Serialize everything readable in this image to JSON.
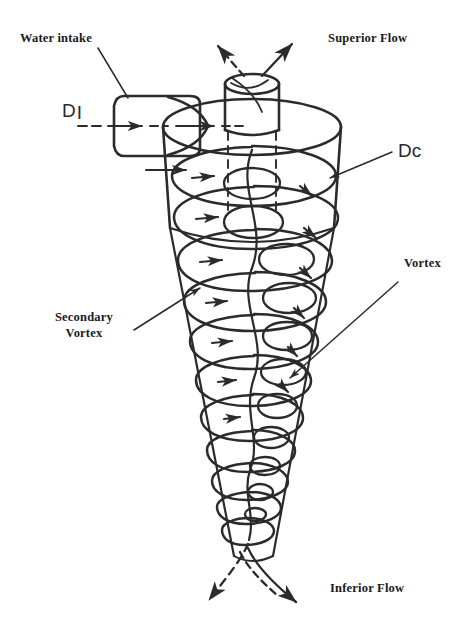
{
  "figure": {
    "type": "technical-line-diagram",
    "background_color": "#ffffff",
    "ink_color": "#2b2b2b",
    "width": 473,
    "height": 640
  },
  "labels": {
    "water_intake": "Water intake",
    "superior_flow": "Superior Flow",
    "inferior_flow": "Inferior Flow",
    "vortex": "Vortex",
    "secondary_vortex": "Secondary\nVortex",
    "secondary_vortex_line1": "Secondary",
    "secondary_vortex_line2": "Vortex",
    "dimension_inlet": "D",
    "dimension_inlet_sub": "I",
    "dimension_cyclone": "Dc"
  },
  "parts": {
    "inlet_pipe": "inlet-pipe",
    "cylindrical_body": "cyclone-cylinder",
    "conical_body": "cyclone-cone",
    "vortex_finder": "vortex-finder-tube",
    "outer_helix": "primary-vortex-helix",
    "inner_helix": "secondary-vortex-helix",
    "center_axis": "dashed-center-axis",
    "overflow_arrows": "superior-flow-arrows",
    "underflow_arrows": "inferior-flow-arrows",
    "intake_arrows": "water-intake-arrows"
  }
}
